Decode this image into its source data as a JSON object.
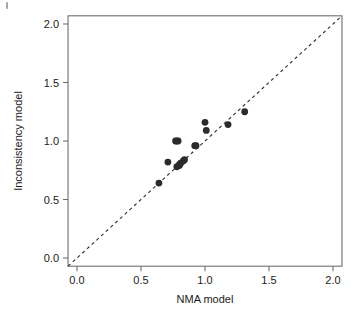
{
  "chart_data": {
    "type": "scatter",
    "title": "",
    "xlabel": "NMA model",
    "ylabel": "Inconsistency model",
    "xlim": [
      -0.07,
      2.07
    ],
    "ylim": [
      -0.07,
      2.07
    ],
    "xticks": [
      0.0,
      0.5,
      1.0,
      1.5,
      2.0
    ],
    "yticks": [
      0.0,
      0.5,
      1.0,
      1.5,
      2.0
    ],
    "xtick_labels": [
      "0.0",
      "0.5",
      "1.0",
      "1.5",
      "2.0"
    ],
    "ytick_labels": [
      "0.0",
      "0.5",
      "1.0",
      "1.5",
      "2.0"
    ],
    "grid": false,
    "legend": null,
    "reference_line": {
      "name": "identity-line",
      "style": "dashed",
      "from": [
        -0.07,
        -0.07
      ],
      "to": [
        2.07,
        2.07
      ],
      "color": "#2b2b2b"
    },
    "marker": {
      "shape": "circle",
      "color": "#2b2b2b",
      "size": 3.4
    },
    "x": [
      0.64,
      0.71,
      0.77,
      0.78,
      0.78,
      0.79,
      0.8,
      0.8,
      0.81,
      0.83,
      0.84,
      0.92,
      0.93,
      1.0,
      1.01,
      1.18,
      1.31
    ],
    "y": [
      0.64,
      0.82,
      1.0,
      1.0,
      0.78,
      1.0,
      0.79,
      0.8,
      0.81,
      0.83,
      0.84,
      0.96,
      0.96,
      1.16,
      1.09,
      1.14,
      1.25
    ],
    "points": [
      {
        "x": 0.64,
        "y": 0.64
      },
      {
        "x": 0.71,
        "y": 0.82
      },
      {
        "x": 0.77,
        "y": 1.0
      },
      {
        "x": 0.78,
        "y": 1.0
      },
      {
        "x": 0.79,
        "y": 1.0
      },
      {
        "x": 0.78,
        "y": 0.78
      },
      {
        "x": 0.8,
        "y": 0.79
      },
      {
        "x": 0.8,
        "y": 0.8
      },
      {
        "x": 0.81,
        "y": 0.81
      },
      {
        "x": 0.83,
        "y": 0.83
      },
      {
        "x": 0.84,
        "y": 0.84
      },
      {
        "x": 0.92,
        "y": 0.96
      },
      {
        "x": 0.93,
        "y": 0.96
      },
      {
        "x": 1.0,
        "y": 1.16
      },
      {
        "x": 1.01,
        "y": 1.09
      },
      {
        "x": 1.18,
        "y": 1.14
      },
      {
        "x": 1.31,
        "y": 1.25
      }
    ],
    "axis_color": "#6f6f6f",
    "background": "#ffffff"
  },
  "figure": {
    "caption": ""
  }
}
